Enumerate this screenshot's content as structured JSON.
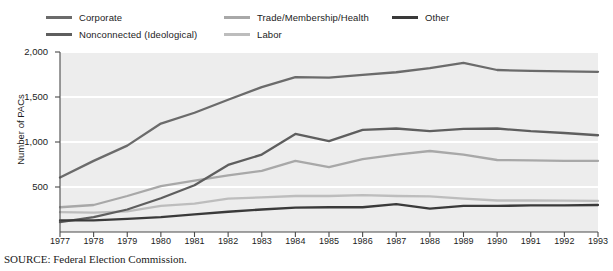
{
  "legend": {
    "items": [
      {
        "label": "Corporate",
        "color": "#6b6b6b",
        "row": 0,
        "col": 0
      },
      {
        "label": "Nonconnected (Ideological)",
        "color": "#5e5e5e",
        "row": 1,
        "col": 0
      },
      {
        "label": "Trade/Membership/Health",
        "color": "#a8a8a8",
        "row": 0,
        "col": 1
      },
      {
        "label": "Labor",
        "color": "#bdbdbd",
        "row": 1,
        "col": 1
      },
      {
        "label": "Other",
        "color": "#3a3a3a",
        "row": 0,
        "col": 2
      }
    ]
  },
  "axes": {
    "ylabel": "Number of PACs",
    "y_ticks": [
      "500",
      "1,000",
      "1,500",
      "2,000"
    ],
    "x_ticks": [
      "1977",
      "1978",
      "1979",
      "1980",
      "1981",
      "1982",
      "1983",
      "1984",
      "1985",
      "1986",
      "1987",
      "1988",
      "1989",
      "1990",
      "1991",
      "1992",
      "1993"
    ]
  },
  "source": "SOURCE: Federal Election Commission.",
  "style": {
    "plot_background": "#ededed",
    "gridline_color": "#ffffff",
    "axis_color": "#4a4a4a",
    "text_color": "#1c1c1c"
  },
  "chart_data": {
    "type": "line",
    "title": "",
    "subtitle": "",
    "xlabel": "",
    "ylabel": "Number of PACs",
    "xlim": [
      1977,
      1993
    ],
    "ylim": [
      0,
      2000
    ],
    "yticks": [
      500,
      1000,
      1500,
      2000
    ],
    "grid": "horizontal-white-on-gray",
    "legend_position": "top",
    "x": [
      1977,
      1978,
      1979,
      1980,
      1981,
      1982,
      1983,
      1984,
      1985,
      1986,
      1987,
      1988,
      1989,
      1990,
      1991,
      1992,
      1993
    ],
    "series": [
      {
        "name": "Corporate",
        "color": "#6b6b6b",
        "values": [
          605,
          790,
          960,
          1205,
          1325,
          1470,
          1610,
          1720,
          1715,
          1745,
          1775,
          1820,
          1880,
          1800,
          1790,
          1785,
          1780
        ]
      },
      {
        "name": "Nonconnected (Ideological)",
        "color": "#5e5e5e",
        "values": [
          110,
          165,
          250,
          375,
          520,
          745,
          860,
          1090,
          1010,
          1135,
          1150,
          1120,
          1145,
          1150,
          1120,
          1100,
          1075
        ]
      },
      {
        "name": "Trade/Membership/Health",
        "color": "#a8a8a8",
        "values": [
          275,
          300,
          400,
          510,
          570,
          630,
          680,
          790,
          720,
          810,
          860,
          900,
          860,
          800,
          795,
          790,
          790
        ]
      },
      {
        "name": "Labor",
        "color": "#bdbdbd",
        "values": [
          220,
          215,
          230,
          290,
          315,
          370,
          385,
          400,
          400,
          410,
          400,
          395,
          370,
          350,
          350,
          348,
          345
        ]
      },
      {
        "name": "Other",
        "color": "#3a3a3a",
        "values": [
          130,
          130,
          145,
          165,
          195,
          225,
          250,
          270,
          275,
          275,
          310,
          260,
          290,
          290,
          295,
          295,
          300
        ]
      }
    ]
  }
}
